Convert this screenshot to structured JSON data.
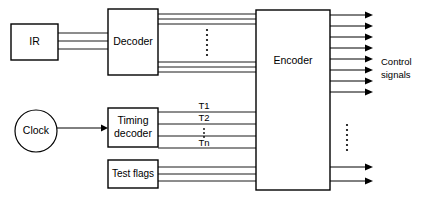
{
  "diagram": {
    "colors": {
      "background": "#ffffff",
      "stroke": "#000000",
      "fill": "#ffffff"
    },
    "blocks": [
      {
        "id": "ir",
        "label": "IR",
        "shape": "rect",
        "x": 11,
        "y": 24,
        "w": 47,
        "h": 36
      },
      {
        "id": "decoder",
        "label": "Decoder",
        "shape": "rect",
        "x": 108,
        "y": 9,
        "w": 50,
        "h": 66
      },
      {
        "id": "encoder",
        "label": "Encoder",
        "shape": "rect",
        "x": 256,
        "y": 10,
        "w": 74,
        "h": 180
      },
      {
        "id": "clock",
        "label": "Clock",
        "shape": "circle",
        "cx": 36,
        "cy": 131,
        "r": 21
      },
      {
        "id": "timing-decoder",
        "label_line1": "Timing",
        "label_line2": "decoder",
        "shape": "rect",
        "x": 108,
        "y": 108,
        "w": 50,
        "h": 39
      },
      {
        "id": "test-flags",
        "label": "Test flags",
        "shape": "rect",
        "x": 108,
        "y": 160,
        "w": 50,
        "h": 28
      }
    ],
    "signal_labels": [
      {
        "id": "t1",
        "text": "T1",
        "x": 204,
        "y": 110
      },
      {
        "id": "t2",
        "text": "T2",
        "x": 204,
        "y": 122
      },
      {
        "id": "tn",
        "text": "Tn",
        "x": 204,
        "y": 144
      }
    ],
    "outside_labels": [
      {
        "id": "control-signals-line1",
        "text": "Control",
        "x": 381,
        "y": 62
      },
      {
        "id": "control-signals-line2",
        "text": "signals",
        "x": 381,
        "y": 75
      }
    ],
    "ellipses": [
      {
        "id": "decoder-bus-ellipsis",
        "cx": 207,
        "cy": 42,
        "dots": 7,
        "spacing": 5
      },
      {
        "id": "timing-bus-ellipsis",
        "cx": 204,
        "cy": 133,
        "dots": 3,
        "spacing": 4
      },
      {
        "id": "control-out-ellipsis",
        "cx": 347,
        "cy": 140,
        "dots": 7,
        "spacing": 5
      }
    ],
    "wire_groups": {
      "ir_to_decoder": {
        "count": 3,
        "ys": [
          33,
          41,
          49
        ],
        "x1": 58,
        "x2": 108
      },
      "decoder_to_encoder_top": {
        "count": 3,
        "ys": [
          14,
          19,
          24
        ],
        "x1": 158,
        "x2": 256
      },
      "decoder_to_encoder_bottom": {
        "count": 3,
        "ys": [
          62,
          67,
          72
        ],
        "x1": 158,
        "x2": 256
      },
      "timing_to_encoder": {
        "count": 4,
        "ys": [
          112,
          124,
          136,
          148
        ],
        "x1": 158,
        "x2": 256
      },
      "testflags_to_encoder": {
        "count": 3,
        "ys": [
          167,
          174,
          181
        ],
        "x1": 158,
        "x2": 256
      },
      "clock_to_timing": {
        "count": 1,
        "ys": [
          128
        ],
        "x1": 57,
        "x2": 106,
        "arrow": true
      },
      "encoder_outputs_top": {
        "count": 8,
        "ys": [
          15,
          26,
          37,
          48,
          59,
          70,
          81,
          92
        ],
        "x1": 330,
        "x2": 372,
        "arrow": true
      },
      "encoder_outputs_bottom": {
        "count": 2,
        "ys": [
          167,
          181
        ],
        "x1": 330,
        "x2": 372,
        "arrow": true
      }
    }
  }
}
